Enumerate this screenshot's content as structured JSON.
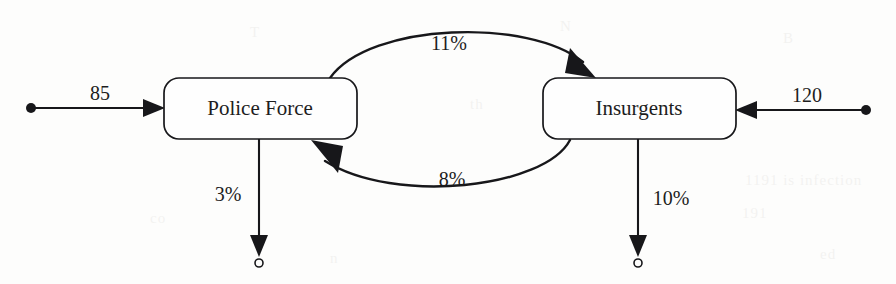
{
  "diagram": {
    "type": "stock-and-flow",
    "background_color": "#fdfdfc",
    "ink_color": "#17171a"
  },
  "nodes": [
    {
      "id": "police",
      "label": "Police Force"
    },
    {
      "id": "insurgents",
      "label": "Insurgents"
    }
  ],
  "flows": {
    "inflow_police": {
      "label": "85",
      "from": "source",
      "to": "police",
      "kind": "inflow",
      "direction": "rightward"
    },
    "inflow_insurgents": {
      "label": "120",
      "from": "source",
      "to": "insurgents",
      "kind": "inflow",
      "direction": "leftward"
    },
    "police_to_insurgents": {
      "label": "11%",
      "from": "police",
      "to": "insurgents",
      "kind": "transfer",
      "direction": "curve-over-top"
    },
    "insurgents_to_police": {
      "label": "8%",
      "from": "insurgents",
      "to": "police",
      "kind": "transfer",
      "direction": "curve-under-bottom"
    },
    "outflow_police": {
      "label": "3%",
      "from": "police",
      "to": "sink",
      "kind": "outflow",
      "direction": "downward"
    },
    "outflow_insurgents": {
      "label": "10%",
      "from": "insurgents",
      "to": "sink",
      "kind": "outflow",
      "direction": "downward"
    }
  },
  "ghost_text": [
    {
      "text": "B",
      "x": 783,
      "y": 30
    },
    {
      "text": "N",
      "x": 560,
      "y": 18
    },
    {
      "text": "T",
      "x": 250,
      "y": 24
    },
    {
      "text": "1191 is infection",
      "x": 745,
      "y": 172
    },
    {
      "text": "191",
      "x": 742,
      "y": 205
    },
    {
      "text": "th",
      "x": 470,
      "y": 96
    },
    {
      "text": "are",
      "x": 640,
      "y": 120
    },
    {
      "text": "co",
      "x": 150,
      "y": 210
    },
    {
      "text": "n",
      "x": 330,
      "y": 250
    },
    {
      "text": "ed",
      "x": 820,
      "y": 246
    }
  ]
}
